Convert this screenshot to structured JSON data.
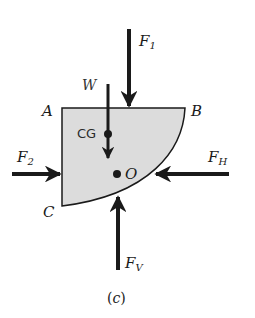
{
  "figure": {
    "caption_open": "(",
    "caption_letter": "c",
    "caption_close": ")",
    "body_fill": "#dcdcdc",
    "stroke_color": "#1a1a1a",
    "points": {
      "A": "A",
      "B": "B",
      "C": "C",
      "O": "O",
      "CG": "CG"
    },
    "weight_label": "W",
    "forces": [
      {
        "id": "F1",
        "base": "F",
        "sub": "1",
        "direction": "down"
      },
      {
        "id": "F2",
        "base": "F",
        "sub": "2",
        "direction": "right"
      },
      {
        "id": "FH",
        "base": "F",
        "sub": "H",
        "direction": "left"
      },
      {
        "id": "FV",
        "base": "F",
        "sub": "V",
        "direction": "up"
      }
    ]
  }
}
